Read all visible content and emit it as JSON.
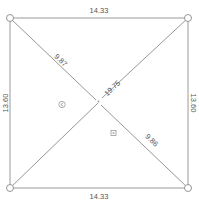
{
  "diagram": {
    "type": "quadrilateral-measurement",
    "colors": {
      "line": "#9a9a9a",
      "text": "#555555",
      "background": "#ffffff"
    },
    "edges": {
      "top": "14.33",
      "bottom": "14.33",
      "left": "13.60",
      "right": "13.60"
    },
    "diagonals": {
      "top_left_segment": "9.87",
      "top_right_segment": "19.75",
      "bottom_right_segment": "9.86"
    },
    "markers": {
      "left_marker": "triangle-marker",
      "right_marker": "square-marker"
    }
  }
}
